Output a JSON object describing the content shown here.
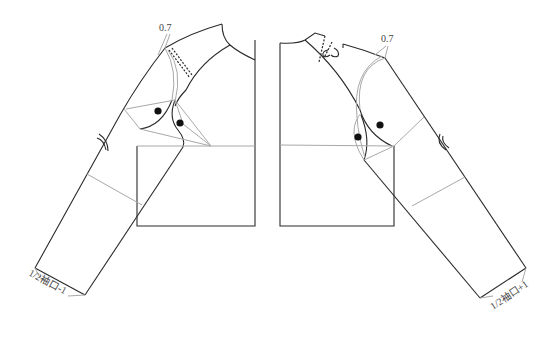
{
  "diagram": {
    "type": "garment pattern draft",
    "left_piece": {
      "name": "back bodice with raglan sleeve",
      "top_label": "0.7",
      "cuff_label": "1/2袖口-1",
      "notch_dots": 2
    },
    "right_piece": {
      "name": "front bodice with raglan sleeve",
      "top_label": "0.7",
      "cuff_label": "1/2袖口+1",
      "notch_dots": 2
    },
    "colors": {
      "outline": "#2a2a2a",
      "guide": "#a8a8a8",
      "background": "#ffffff"
    }
  }
}
